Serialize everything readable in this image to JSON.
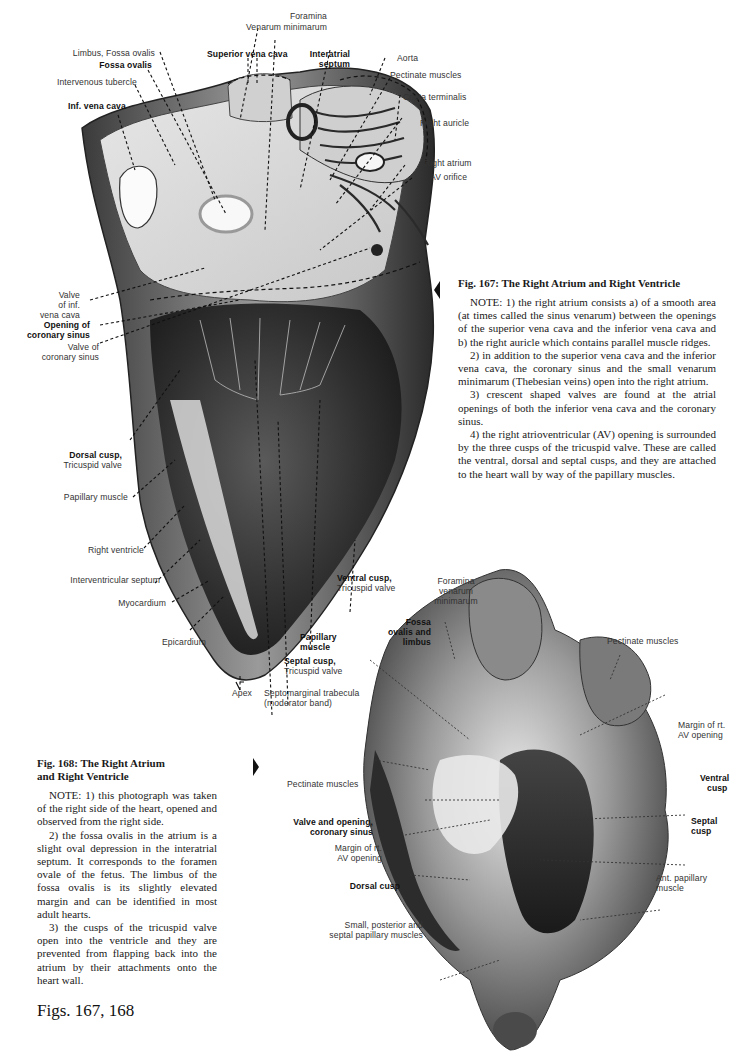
{
  "figure_167": {
    "caption": {
      "title": "Fig. 167: The Right Atrium and Right Ventricle",
      "notes": [
        "NOTE: 1) the right atrium consists a) of a smooth area (at times called the sinus venarum) between the openings of the superior vena cava and the inferior vena cava and b) the right auricle which contains parallel muscle ridges.",
        "2) in addition to the superior vena cava and the inferior vena cava, the coronary sinus and the small venarum minimarum (Thebesian veins) open into the right atrium.",
        "3) crescent shaped valves are found at the atrial openings of both the inferior vena cava and the coronary sinus.",
        "4) the right atrioventricular (AV) opening is surrounded by the three cusps of the tricuspid valve. These are called the ventral, dorsal and septal cusps, and they are attached to the heart wall by way of the papillary muscles."
      ]
    },
    "labels": {
      "foramina": "Foramina",
      "venarum_minimarum": "Venarum minimarum",
      "limbus_fossa_ovalis": "Limbus, Fossa ovalis",
      "fossa_ovalis": "Fossa ovalis",
      "superior_vena_cava": "Superior vena cava",
      "interatrial": "Interatrial",
      "septum": "septum",
      "intervenous_tubercle": "Intervenous tubercle",
      "inf_vena_cava": "Inf. vena cava",
      "aorta": "Aorta",
      "pectinate_muscles": "Pectinate muscles",
      "crista_terminalis": "Crista terminalis",
      "right_auricle": "Right auricle",
      "right_atrium": "Right atrium",
      "av_orifice": "AV orifice",
      "valve_of": "Valve",
      "of_inf": "of inf.",
      "vena_cava": "vena cava",
      "opening_of": "Opening of",
      "coronary_sinus": "coronary sinus",
      "valve_of_cs1": "Valve of",
      "valve_of_cs2": "coronary sinus",
      "dorsal_cusp": "Dorsal cusp,",
      "tricuspid_valve_1": "Tricuspid valve",
      "papillary_muscle": "Papillary muscle",
      "right_ventricle": "Right ventricle",
      "interventricular_septum": "Interventricular septum",
      "myocardium": "Myocardium",
      "epicardium": "Epicardium",
      "apex": "Apex",
      "septomarginal_1": "Septomarginal trabecula",
      "septomarginal_2": "(moderator band)",
      "septal_cusp": "Septal cusp,",
      "tricuspid_valve_2": "Tricuspid valve",
      "papillary": "Papillary",
      "muscle": "muscle",
      "ventral_cusp": "Ventral cusp,",
      "tricuspid_valve_3": "Tricuspid valve"
    }
  },
  "figure_168": {
    "caption": {
      "title_line1": "Fig. 168: The Right Atrium",
      "title_line2": "and Right Ventricle",
      "notes": [
        "NOTE: 1) this photograph was taken of the right side of the heart, opened and observed from the right side.",
        "2) the fossa ovalis in the atrium is a slight oval depression in the interatrial septum. It corresponds to the foramen ovale of the fetus. The limbus of the fossa ovalis is its slightly elevated margin and can be identified in most adult hearts.",
        "3) the cusps of the tricuspid valve open into the ventricle and they are prevented from flapping back into the atrium by their attachments onto the heart wall."
      ]
    },
    "labels": {
      "foramina": "Foramina",
      "venarum": "venarum",
      "minimarum": "minimarum",
      "fossa": "Fossa",
      "ovalis_and": "ovalis and",
      "limbus": "limbus",
      "pectinate_muscles_top": "Pectinate muscles",
      "margin_rt_1": "Margin of rt.",
      "av_opening_1": "AV opening",
      "pectinate_muscles_left": "Pectinate muscles",
      "ventral": "Ventral",
      "cusp_v": "cusp",
      "valve_and_opening": "Valve and opening,",
      "coronary_sinus": "coronary sinus",
      "septal": "Septal",
      "cusp_s": "cusp",
      "margin_rt_2": "Margin of rt.",
      "av_opening_2": "AV opening",
      "ant_papillary": "Ant. papillary",
      "muscle": "muscle",
      "dorsal_cusp": "Dorsal cusp",
      "small_posterior": "Small, posterior and",
      "septal_papillary": "septal papillary muscles"
    }
  },
  "page": {
    "figs_label": "Figs. 167, 168"
  }
}
